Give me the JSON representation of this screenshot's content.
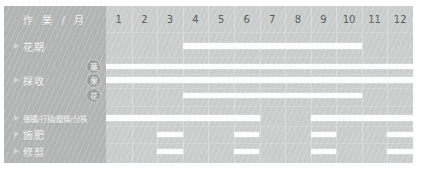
{
  "header": {
    "title": "作 業 / 月"
  },
  "months": [
    "1",
    "2",
    "3",
    "4",
    "5",
    "6",
    "7",
    "8",
    "9",
    "10",
    "11",
    "12"
  ],
  "rows": [
    {
      "label": "花期",
      "badge": null
    },
    {
      "label": "",
      "badge": "葉"
    },
    {
      "label": "採收",
      "badge": "果"
    },
    {
      "label": "",
      "badge": "花"
    },
    {
      "label": "播種/扦插/壓條/分株",
      "badge": null
    },
    {
      "label": "施肥",
      "badge": null
    },
    {
      "label": "修剪",
      "badge": null
    }
  ],
  "colors": {
    "panel": "#c9cbca",
    "label_column": "#b3b5b4",
    "grid": "#cbcdcc",
    "bar": "#fdfdfd",
    "badge": "#9a9c9b",
    "page": "#ffffff"
  },
  "chart_data": {
    "type": "bar",
    "title": "作 業 / 月",
    "xlabel": "月",
    "ylabel": "作業",
    "categories": [
      "1",
      "2",
      "3",
      "4",
      "5",
      "6",
      "7",
      "8",
      "9",
      "10",
      "11",
      "12"
    ],
    "xlim": [
      1,
      13
    ],
    "grid": true,
    "legend": "none",
    "orientation": "horizontal-gantt",
    "series": [
      {
        "name": "花期",
        "badge": null,
        "spans": [
          [
            4,
            11
          ]
        ]
      },
      {
        "name": "採收-葉",
        "badge": "葉",
        "spans": [
          [
            1,
            13
          ]
        ]
      },
      {
        "name": "採收-果",
        "badge": "果",
        "spans": [
          [
            1,
            13
          ]
        ]
      },
      {
        "name": "採收-花",
        "badge": "花",
        "spans": [
          [
            4,
            11
          ]
        ]
      },
      {
        "name": "播種/扦插/壓條/分株",
        "badge": null,
        "spans": [
          [
            1,
            7
          ],
          [
            9,
            13
          ]
        ]
      },
      {
        "name": "施肥",
        "badge": null,
        "spans": [
          [
            3,
            4
          ],
          [
            6,
            7
          ],
          [
            9,
            10
          ],
          [
            12,
            13
          ]
        ]
      },
      {
        "name": "修剪",
        "badge": null,
        "spans": [
          [
            3,
            4
          ],
          [
            6,
            7
          ],
          [
            9,
            10
          ],
          [
            12,
            13
          ]
        ]
      }
    ]
  }
}
